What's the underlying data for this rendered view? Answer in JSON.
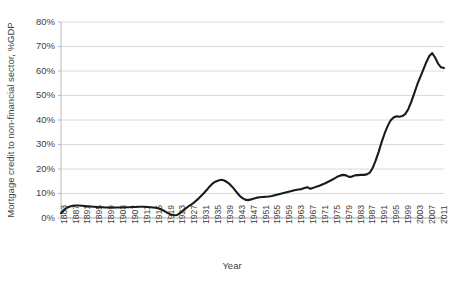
{
  "chart_data": {
    "type": "line",
    "title": "",
    "subtitle": "",
    "xlabel": "Year",
    "ylabel": "Mortgage credit to non-financial sector, %GDP",
    "xlim": [
      1883,
      2012
    ],
    "ylim": [
      0,
      80
    ],
    "ytick_labels": [
      "0%",
      "10%",
      "20%",
      "30%",
      "40%",
      "50%",
      "60%",
      "70%",
      "80%"
    ],
    "ytick_values": [
      0,
      10,
      20,
      30,
      40,
      50,
      60,
      70,
      80
    ],
    "xtick_labels": [
      "1883",
      "1887",
      "1891",
      "1895",
      "1899",
      "1903",
      "1907",
      "1911",
      "1915",
      "1919",
      "1923",
      "1927",
      "1931",
      "1935",
      "1939",
      "1943",
      "1947",
      "1951",
      "1955",
      "1959",
      "1963",
      "1967",
      "1971",
      "1975",
      "1979",
      "1983",
      "1987",
      "1991",
      "1995",
      "1999",
      "2003",
      "2007",
      "2011"
    ],
    "xtick_values": [
      1883,
      1887,
      1891,
      1895,
      1899,
      1903,
      1907,
      1911,
      1915,
      1919,
      1923,
      1927,
      1931,
      1935,
      1939,
      1943,
      1947,
      1951,
      1955,
      1959,
      1963,
      1967,
      1971,
      1975,
      1979,
      1983,
      1987,
      1991,
      1995,
      1999,
      2003,
      2007,
      2011
    ],
    "grid": true,
    "grid_axis": "y",
    "legend": false,
    "legend_position": "none",
    "line_color": "#1a1a1a",
    "grid_color": "#d0d0d0",
    "axis_color": "#b3b3b3",
    "background_color": "#ffffff",
    "series": [
      {
        "name": "Mortgage credit to non-financial sector",
        "x": [
          1883,
          1884,
          1885,
          1886,
          1887,
          1888,
          1889,
          1890,
          1891,
          1892,
          1893,
          1894,
          1895,
          1896,
          1897,
          1898,
          1899,
          1900,
          1901,
          1902,
          1903,
          1904,
          1905,
          1906,
          1907,
          1908,
          1909,
          1910,
          1911,
          1912,
          1913,
          1914,
          1915,
          1916,
          1917,
          1918,
          1919,
          1920,
          1921,
          1922,
          1923,
          1924,
          1925,
          1926,
          1927,
          1928,
          1929,
          1930,
          1931,
          1932,
          1933,
          1934,
          1935,
          1936,
          1937,
          1938,
          1939,
          1940,
          1941,
          1942,
          1943,
          1944,
          1945,
          1946,
          1947,
          1948,
          1949,
          1950,
          1951,
          1952,
          1953,
          1954,
          1955,
          1956,
          1957,
          1958,
          1959,
          1960,
          1961,
          1962,
          1963,
          1964,
          1965,
          1966,
          1967,
          1968,
          1969,
          1970,
          1971,
          1972,
          1973,
          1974,
          1975,
          1976,
          1977,
          1978,
          1979,
          1980,
          1981,
          1982,
          1983,
          1984,
          1985,
          1986,
          1987,
          1988,
          1989,
          1990,
          1991,
          1992,
          1993,
          1994,
          1995,
          1996,
          1997,
          1998,
          1999,
          2000,
          2001,
          2002,
          2003,
          2004,
          2005,
          2006,
          2007,
          2008,
          2009,
          2010,
          2011,
          2012
        ],
        "values": [
          2.0,
          3.3,
          4.2,
          4.7,
          5.0,
          5.1,
          5.1,
          5.0,
          4.9,
          4.8,
          4.7,
          4.6,
          4.5,
          4.4,
          4.4,
          4.3,
          4.3,
          4.3,
          4.3,
          4.3,
          4.3,
          4.3,
          4.4,
          4.4,
          4.5,
          4.5,
          4.6,
          4.6,
          4.6,
          4.5,
          4.4,
          4.3,
          4.2,
          3.9,
          3.4,
          2.7,
          2.0,
          1.4,
          1.1,
          1.2,
          1.9,
          2.9,
          3.9,
          4.8,
          5.6,
          6.5,
          7.6,
          8.8,
          10.0,
          11.3,
          12.8,
          14.0,
          14.8,
          15.3,
          15.6,
          15.3,
          14.6,
          13.6,
          12.3,
          10.8,
          9.3,
          8.2,
          7.5,
          7.3,
          7.6,
          8.0,
          8.3,
          8.5,
          8.6,
          8.7,
          8.8,
          9.0,
          9.3,
          9.6,
          9.9,
          10.2,
          10.5,
          10.8,
          11.1,
          11.4,
          11.6,
          11.8,
          12.2,
          12.6,
          11.9,
          12.3,
          12.8,
          13.2,
          13.7,
          14.2,
          14.8,
          15.4,
          16.1,
          16.8,
          17.3,
          17.6,
          17.4,
          16.8,
          16.9,
          17.4,
          17.5,
          17.6,
          17.6,
          17.8,
          18.5,
          20.5,
          23.5,
          27.0,
          31.0,
          34.5,
          37.5,
          39.8,
          41.0,
          41.5,
          41.3,
          41.6,
          42.5,
          44.5,
          47.5,
          51.0,
          54.5,
          57.5,
          60.5,
          63.5,
          66.0,
          67.3,
          65.5,
          63.0,
          61.5,
          61.2
        ]
      }
    ]
  },
  "axis": {
    "x_title": "Year",
    "y_title": "Mortgage credit to non-financial sector, %GDP"
  }
}
